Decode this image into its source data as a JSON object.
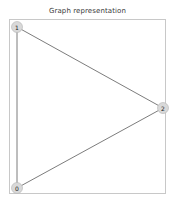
{
  "figure": {
    "title": "Graph representation",
    "width": 175,
    "height": 206,
    "background_color": "#ffffff"
  },
  "axes": {
    "frame_color": "#c8c8c8",
    "left": 9,
    "top": 19,
    "width": 157,
    "height": 175,
    "grid": false,
    "xticks": [],
    "yticks": []
  },
  "chart_data": {
    "type": "graph",
    "title": "Graph representation",
    "xlabel": "",
    "ylabel": "",
    "directed": false,
    "node_color": "#d9d9d9",
    "node_edge_color": "#b4b4b4",
    "edge_color": "#5a5a5a",
    "label_color": "#1a1a1a",
    "node_radius": 5.5,
    "nodes": [
      {
        "id": "1",
        "label": "1",
        "x": 17,
        "y": 27
      },
      {
        "id": "2",
        "label": "2",
        "x": 163,
        "y": 108
      },
      {
        "id": "0",
        "label": "0",
        "x": 17,
        "y": 188
      }
    ],
    "edges": [
      {
        "source": "1",
        "target": "0",
        "x1": 17,
        "y1": 27,
        "x2": 17,
        "y2": 188
      },
      {
        "source": "1",
        "target": "2",
        "x1": 17,
        "y1": 27,
        "x2": 163,
        "y2": 108
      },
      {
        "source": "0",
        "target": "2",
        "x1": 17,
        "y1": 188,
        "x2": 163,
        "y2": 108
      }
    ]
  }
}
